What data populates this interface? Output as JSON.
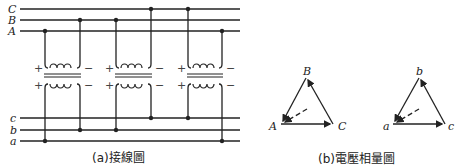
{
  "primary_bus": {
    "labels": [
      "C",
      "B",
      "A"
    ]
  },
  "secondary_bus": {
    "labels": [
      "c",
      "b",
      "a"
    ]
  },
  "transformer": {
    "plus": "+",
    "minus": "−"
  },
  "captions": {
    "wiring": "(a)接線圖",
    "phasor": "(b)電壓相量圖"
  },
  "phasor_primary": {
    "top": "B",
    "left": "A",
    "right": "C"
  },
  "phasor_secondary": {
    "top": "b",
    "left": "a",
    "right": "c"
  }
}
